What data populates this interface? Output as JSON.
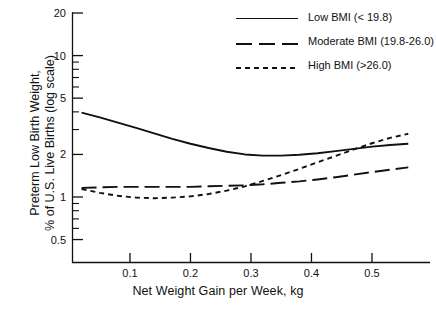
{
  "chart_data": {
    "type": "line",
    "title": "",
    "xlabel": "Net Weight Gain per Week, kg",
    "ylabel": "Preterm Low Birth Weight, % of U.S. Live Births (log scale)",
    "ylabel_line1": "Preterm Low Birth Weight,",
    "ylabel_line2": "% of U.S. Live Births (log scale)",
    "yscale": "log",
    "ylim": [
      0.45,
      21
    ],
    "xlim": [
      0.005,
      0.59
    ],
    "grid": false,
    "legend_position": "top-right",
    "xticks": [
      0.1,
      0.2,
      0.3,
      0.4,
      0.5
    ],
    "xtick_labels": [
      "0.1",
      "0.2",
      "0.3",
      "0.4",
      "0.5"
    ],
    "yticks": [
      0.5,
      1,
      2,
      5,
      10,
      20
    ],
    "ytick_labels": [
      "0.5",
      "1",
      "2",
      "5",
      "10",
      "20"
    ],
    "yminor_ticks": [
      0.6,
      0.7,
      0.8,
      0.9,
      3,
      4,
      6,
      7,
      8,
      9
    ],
    "series": [
      {
        "name": "Low BMI (< 19.8)",
        "style": "solid",
        "color": "#111111",
        "x": [
          0.02,
          0.05,
          0.08,
          0.11,
          0.14,
          0.17,
          0.2,
          0.23,
          0.26,
          0.29,
          0.32,
          0.35,
          0.38,
          0.41,
          0.44,
          0.47,
          0.5,
          0.53,
          0.56
        ],
        "y": [
          3.95,
          3.66,
          3.36,
          3.08,
          2.82,
          2.58,
          2.38,
          2.22,
          2.09,
          2.0,
          1.96,
          1.96,
          1.99,
          2.04,
          2.11,
          2.19,
          2.27,
          2.33,
          2.38
        ]
      },
      {
        "name": "Moderate BMI (19.8-26.0)",
        "style": "long-dash",
        "color": "#111111",
        "x": [
          0.02,
          0.05,
          0.08,
          0.11,
          0.14,
          0.17,
          0.2,
          0.23,
          0.26,
          0.29,
          0.32,
          0.35,
          0.38,
          0.41,
          0.44,
          0.47,
          0.5,
          0.53,
          0.56
        ],
        "y": [
          1.16,
          1.17,
          1.18,
          1.18,
          1.18,
          1.18,
          1.18,
          1.19,
          1.2,
          1.21,
          1.23,
          1.26,
          1.29,
          1.33,
          1.38,
          1.44,
          1.5,
          1.56,
          1.62
        ]
      },
      {
        "name": "High BMI (>26.0)",
        "style": "short-dash",
        "color": "#111111",
        "x": [
          0.02,
          0.05,
          0.08,
          0.11,
          0.14,
          0.17,
          0.2,
          0.23,
          0.26,
          0.29,
          0.32,
          0.35,
          0.38,
          0.41,
          0.44,
          0.47,
          0.5,
          0.53,
          0.56
        ],
        "y": [
          1.14,
          1.07,
          1.02,
          0.99,
          0.98,
          0.99,
          1.01,
          1.05,
          1.11,
          1.19,
          1.3,
          1.43,
          1.58,
          1.76,
          1.95,
          2.17,
          2.4,
          2.62,
          2.8
        ]
      }
    ]
  },
  "legend": {
    "items": [
      {
        "label": "Low BMI (< 19.8)",
        "style": "solid"
      },
      {
        "label": "Moderate BMI (19.8-26.0)",
        "style": "long-dash"
      },
      {
        "label": "High BMI (>26.0)",
        "style": "short-dash"
      }
    ]
  }
}
